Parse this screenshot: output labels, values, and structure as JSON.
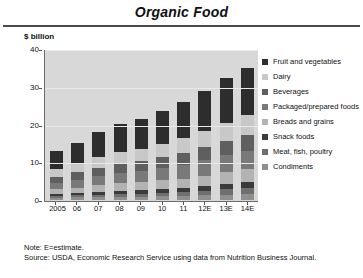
{
  "header": {
    "title": "Organic Food"
  },
  "notes": {
    "line1": "Note: E=estimate.",
    "line2": "Source: USDA, Economic Research Service using data from Nutrition Business Journal."
  },
  "chart_data": {
    "type": "bar",
    "stacked": true,
    "title": "Organic Food",
    "xlabel": "",
    "ylabel": "$ billion",
    "ylim": [
      0,
      40
    ],
    "yticks": [
      0,
      10,
      20,
      30,
      40
    ],
    "grid": true,
    "legend_position": "right",
    "plot_background": "#d8d8d8",
    "categories": [
      "2005",
      "06",
      "07",
      "08",
      "09",
      "10",
      "11",
      "12E",
      "13E",
      "14E"
    ],
    "series": [
      {
        "name": "Condiments",
        "color": "#8f8f8f",
        "values": [
          0.6,
          0.7,
          0.8,
          0.9,
          0.9,
          1.0,
          1.1,
          1.2,
          1.4,
          1.5
        ]
      },
      {
        "name": "Meat, fish, poultry",
        "color": "#6f6f6f",
        "values": [
          0.4,
          0.5,
          0.6,
          0.7,
          0.8,
          0.9,
          1.0,
          1.2,
          1.4,
          1.6
        ]
      },
      {
        "name": "Snack foods",
        "color": "#3a3a3a",
        "values": [
          0.5,
          0.6,
          0.7,
          0.8,
          0.9,
          1.0,
          1.1,
          1.3,
          1.5,
          1.7
        ]
      },
      {
        "name": "Breads and grains",
        "color": "#b3b3b3",
        "values": [
          1.3,
          1.5,
          1.8,
          2.0,
          2.1,
          2.3,
          2.5,
          2.8,
          3.1,
          3.4
        ]
      },
      {
        "name": "Packaged/prepared foods",
        "color": "#797979",
        "values": [
          1.8,
          2.1,
          2.5,
          2.8,
          3.0,
          3.3,
          3.6,
          4.0,
          4.4,
          4.8
        ]
      },
      {
        "name": "Beverages",
        "color": "#5f5f5f",
        "values": [
          1.6,
          1.9,
          2.2,
          2.5,
          2.6,
          2.9,
          3.2,
          3.5,
          3.9,
          4.3
        ]
      },
      {
        "name": "Dairy",
        "color": "#c8c8c8",
        "values": [
          2.0,
          2.3,
          2.7,
          3.0,
          3.2,
          3.5,
          3.9,
          4.3,
          4.8,
          5.2
        ]
      },
      {
        "name": "Fruit and vegetables",
        "color": "#2d2d2d",
        "values": [
          4.8,
          5.6,
          6.7,
          7.4,
          7.9,
          8.6,
          9.6,
          10.7,
          11.8,
          12.5
        ]
      }
    ],
    "totals": [
      13.0,
      15.2,
      18.0,
      20.1,
      21.4,
      23.5,
      26.0,
      29.0,
      32.3,
      35.0
    ]
  }
}
